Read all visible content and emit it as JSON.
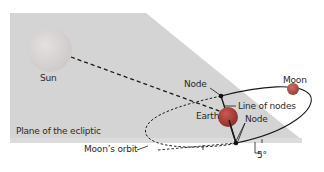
{
  "diagram": {
    "labels": {
      "sun": "Sun",
      "moon": "Moon",
      "node_upper": "Node",
      "node_lower": "Node",
      "line_of_nodes": "Line of nodes",
      "earth": "Earth",
      "plane": "Plane of the ecliptic",
      "moons_orbit": "Moon’s orbit",
      "angle": "5°"
    },
    "colors": {
      "plane": "#d3d3d3",
      "sun": "#d9d5d4",
      "earth": "#b2443c",
      "moon": "#b8544c",
      "line": "#1a1a1a"
    }
  }
}
